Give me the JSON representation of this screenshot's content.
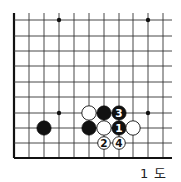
{
  "diagram": {
    "type": "go-board-fragment",
    "caption": "1 도",
    "grid": {
      "columns_x": [
        14,
        29,
        44,
        59,
        74,
        89,
        104,
        119,
        133,
        148,
        163
      ],
      "rows_y": [
        20,
        36,
        51,
        66,
        82,
        97,
        113,
        128,
        143,
        158
      ],
      "line_right_end": 172,
      "line_top_start": 13,
      "left_edge_is_board_edge": true,
      "bottom_edge_is_board_edge": true
    },
    "star_points": [
      {
        "col": 3,
        "row": 0
      },
      {
        "col": 9,
        "row": 0
      },
      {
        "col": 3,
        "row": 6
      },
      {
        "col": 9,
        "row": 6
      }
    ],
    "stones": [
      {
        "color": "black",
        "col": 2,
        "row": 7,
        "label": ""
      },
      {
        "color": "white",
        "col": 5,
        "row": 6,
        "label": ""
      },
      {
        "color": "black",
        "col": 6,
        "row": 6,
        "label": ""
      },
      {
        "color": "black",
        "col": 7,
        "row": 6,
        "label": "3"
      },
      {
        "color": "black",
        "col": 5,
        "row": 7,
        "label": ""
      },
      {
        "color": "white",
        "col": 6,
        "row": 7,
        "label": ""
      },
      {
        "color": "black",
        "col": 7,
        "row": 7,
        "label": "1"
      },
      {
        "color": "white",
        "col": 8,
        "row": 7,
        "label": ""
      },
      {
        "color": "white",
        "col": 6,
        "row": 8,
        "label": "2"
      },
      {
        "color": "white",
        "col": 7,
        "row": 8,
        "label": "4"
      }
    ],
    "colors": {
      "line": "#333333",
      "edge": "#111111",
      "black_stone": "#111111",
      "white_stone": "#ffffff",
      "background": "#ffffff"
    }
  }
}
